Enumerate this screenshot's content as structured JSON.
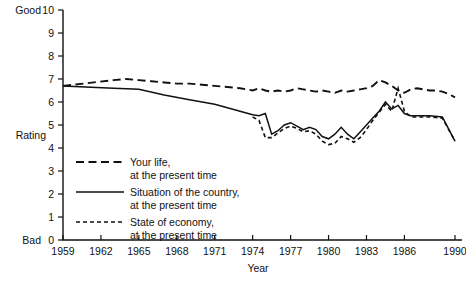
{
  "chart_data": {
    "type": "line",
    "title": "",
    "xlabel": "Year",
    "ylabel": "Rating",
    "ylim": [
      0,
      10
    ],
    "xlim": [
      1959,
      1990
    ],
    "grid": false,
    "legend_position": "inside-left",
    "y_ticks": [
      0,
      1,
      2,
      3,
      4,
      5,
      6,
      7,
      8,
      9,
      10
    ],
    "y_tick_labels": [
      "0",
      "1",
      "2",
      "3",
      "4",
      "5",
      "6",
      "7",
      "8",
      "9",
      "10"
    ],
    "y_axis_top_label": "Good",
    "y_axis_bottom_label": "Bad",
    "x_ticks": [
      1959,
      1962,
      1965,
      1968,
      1971,
      1974,
      1977,
      1980,
      1983,
      1986,
      1990
    ],
    "x_tick_labels": [
      "1959",
      "1962",
      "1965",
      "1968",
      "1971",
      "1974",
      "1977",
      "1980",
      "1983",
      "1986",
      "1990"
    ],
    "series": [
      {
        "name": "Your life, at the present time",
        "style": "dashed",
        "x": [
          1959,
          1963,
          1964,
          1965,
          1966,
          1967,
          1968,
          1969,
          1970,
          1971,
          1972,
          1973,
          1974,
          1974.5,
          1975,
          1975.5,
          1976,
          1976.5,
          1977,
          1977.5,
          1978,
          1978.5,
          1979,
          1979.5,
          1980,
          1980.5,
          1981,
          1981.5,
          1982,
          1982.5,
          1983,
          1983.5,
          1984,
          1984.5,
          1985,
          1985.5,
          1986,
          1986.5,
          1987,
          1987.5,
          1988,
          1988.5,
          1989,
          1989.5,
          1990
        ],
        "values": [
          6.7,
          6.95,
          7.0,
          6.95,
          6.9,
          6.85,
          6.8,
          6.8,
          6.75,
          6.7,
          6.65,
          6.6,
          6.5,
          6.6,
          6.5,
          6.45,
          6.5,
          6.45,
          6.5,
          6.6,
          6.55,
          6.5,
          6.45,
          6.5,
          6.45,
          6.4,
          6.5,
          6.45,
          6.5,
          6.55,
          6.6,
          6.7,
          6.95,
          6.85,
          6.7,
          6.5,
          6.4,
          6.55,
          6.6,
          6.55,
          6.5,
          6.5,
          6.45,
          6.35,
          6.2
        ]
      },
      {
        "name": "Situation of the country, at the present time",
        "style": "solid",
        "x": [
          1959,
          1963,
          1965,
          1967,
          1969,
          1971,
          1972,
          1973,
          1974,
          1974.5,
          1975,
          1975.5,
          1976,
          1976.5,
          1977,
          1977.5,
          1978,
          1978.5,
          1979,
          1979.5,
          1980,
          1980.5,
          1981,
          1981.5,
          1982,
          1982.5,
          1983,
          1983.5,
          1984,
          1984.5,
          1985,
          1985.5,
          1986,
          1986.5,
          1987,
          1988,
          1989,
          1990
        ],
        "values": [
          6.7,
          6.6,
          6.55,
          6.3,
          6.1,
          5.9,
          5.75,
          5.6,
          5.45,
          5.4,
          5.5,
          4.6,
          4.75,
          5.0,
          5.1,
          4.95,
          4.8,
          4.9,
          4.8,
          4.5,
          4.4,
          4.6,
          4.9,
          4.6,
          4.4,
          4.7,
          5.0,
          5.3,
          5.6,
          6.0,
          5.7,
          5.85,
          5.5,
          5.4,
          5.4,
          5.4,
          5.35,
          4.3
        ]
      },
      {
        "name": "State of economy, at the present time",
        "style": "dotted",
        "x": [
          1974,
          1974.5,
          1975,
          1975.5,
          1976,
          1976.5,
          1977,
          1977.5,
          1978,
          1978.5,
          1979,
          1979.5,
          1980,
          1980.5,
          1981,
          1981.5,
          1982,
          1982.5,
          1983,
          1983.5,
          1984,
          1984.5,
          1985,
          1985.5,
          1986,
          1986.5,
          1987,
          1988,
          1989,
          1990
        ],
        "values": [
          5.35,
          5.2,
          4.45,
          4.45,
          4.65,
          4.85,
          4.95,
          4.85,
          4.7,
          4.75,
          4.6,
          4.3,
          4.15,
          4.2,
          4.5,
          4.4,
          4.25,
          4.45,
          4.8,
          5.2,
          5.55,
          5.9,
          5.6,
          6.6,
          5.6,
          5.35,
          5.35,
          5.35,
          5.3,
          4.3
        ]
      }
    ]
  },
  "legend": {
    "entries": [
      {
        "line1": "Your life,",
        "line2": "at the present time",
        "style": "dashed"
      },
      {
        "line1": "Situation of the country,",
        "line2": "at the present time",
        "style": "solid"
      },
      {
        "line1": "State of economy,",
        "line2": "at the present time",
        "style": "dotted"
      }
    ]
  },
  "colors": {
    "ink": "#111111",
    "background": "#ffffff"
  }
}
